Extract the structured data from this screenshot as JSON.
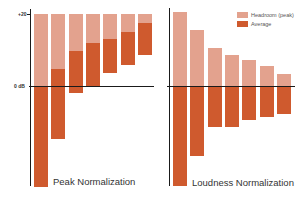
{
  "chart_data": [
    {
      "type": "bar",
      "title": "Peak Normalization",
      "xlabel": "",
      "ylabel": "",
      "y_ticks": [
        "+20",
        "0 dB"
      ],
      "ylim": [
        -28,
        20
      ],
      "grid": false,
      "bar_style": "floating ranges (stacked: headroom above average)",
      "categories": [
        "1",
        "2",
        "3",
        "4",
        "5",
        "6",
        "7"
      ],
      "series": [
        {
          "name": "Peak",
          "values": [
            20,
            20,
            20,
            20,
            20,
            20,
            20
          ]
        },
        {
          "name": "Average top",
          "values": [
            0,
            4.7,
            9.7,
            11.9,
            13.1,
            15.0,
            17.5
          ]
        },
        {
          "name": "Average bottom",
          "values": [
            -28.1,
            -14.7,
            -1.9,
            0,
            3.6,
            5.8,
            8.6
          ]
        }
      ]
    },
    {
      "type": "bar",
      "title": "Loudness Normalization",
      "xlabel": "",
      "ylabel": "",
      "ylim": [
        -28,
        20
      ],
      "grid": false,
      "legend": {
        "position": "top-right",
        "entries": [
          "Headroom (peak)",
          "Average"
        ]
      },
      "bar_style": "floating ranges (headroom from 0 dB to peak, average from 0 dB down)",
      "categories": [
        "1",
        "2",
        "3",
        "4",
        "5",
        "6",
        "7"
      ],
      "series": [
        {
          "name": "Peak",
          "values": [
            20.6,
            15.6,
            10.6,
            8.6,
            7.2,
            5.6,
            3.3
          ]
        },
        {
          "name": "Average top",
          "values": [
            0,
            0,
            0,
            0,
            0,
            0,
            0
          ]
        },
        {
          "name": "Average bottom",
          "values": [
            -27.8,
            -19.4,
            -11.4,
            -11.4,
            -9.4,
            -8.6,
            -7.8
          ]
        }
      ]
    }
  ],
  "axis": {
    "top_label": "+20",
    "zero_label": "0 dB"
  },
  "legend": {
    "headroom_label": "Headroom (peak)",
    "average_label": "Average"
  },
  "titles": {
    "left": "Peak Normalization",
    "right": "Loudness Normalization"
  },
  "colors": {
    "headroom": "#E3A28E",
    "average": "#CF5A2E",
    "axis": "#1a1a1a"
  }
}
